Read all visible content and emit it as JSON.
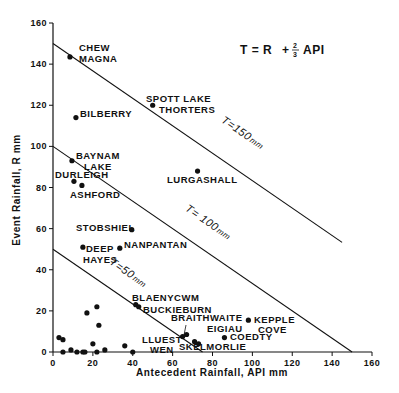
{
  "chart_data": {
    "type": "scatter",
    "title": "",
    "formula": {
      "text_left": "T = R",
      "plus": "+",
      "frac_num": "2",
      "frac_den": "3",
      "text_right": "API"
    },
    "xlabel": "Antecedent Rainfall, API mm",
    "ylabel": "Event Rainfall, R mm",
    "xlim": [
      0,
      160
    ],
    "ylim": [
      0,
      160
    ],
    "x_ticks": [
      0,
      20,
      40,
      60,
      80,
      100,
      120,
      140,
      160
    ],
    "y_ticks": [
      0,
      20,
      40,
      60,
      80,
      100,
      120,
      140,
      160
    ],
    "grid": false,
    "reference_lines": [
      {
        "name": "T=50mm",
        "label": "T=50mm",
        "T": 50,
        "points": [
          [
            0,
            50
          ],
          [
            75,
            0
          ]
        ]
      },
      {
        "name": "T=100mm",
        "label": "T=100mm",
        "T": 100,
        "points": [
          [
            0,
            100
          ],
          [
            150,
            0
          ]
        ]
      },
      {
        "name": "T=150mm",
        "label": "T=150mm",
        "T": 150,
        "points": [
          [
            0,
            150
          ],
          [
            145,
            53.3
          ]
        ]
      }
    ],
    "labeled_points": [
      {
        "label": "CHEW MAGNA",
        "lines": [
          "CHEW",
          "MAGNA"
        ],
        "x": 8.5,
        "y": 143.5
      },
      {
        "label": "BILBERRY",
        "lines": [
          "BILBERRY"
        ],
        "x": 11.5,
        "y": 114
      },
      {
        "label": "SPOTT LAKE / THORTERS",
        "lines": [
          "SPOTT LAKE",
          "THORTERS"
        ],
        "x": 50,
        "y": 120
      },
      {
        "label": "BAYNAM LAKE",
        "lines": [
          "BAYNAM",
          "LAKE"
        ],
        "x": 9.5,
        "y": 93
      },
      {
        "label": "DURLEIGH",
        "lines": [
          "DURLEIGH"
        ],
        "x": 10.5,
        "y": 83
      },
      {
        "label": "ASHFORD",
        "lines": [
          "ASHFORD"
        ],
        "x": 14.5,
        "y": 81
      },
      {
        "label": "LURGASHALL",
        "lines": [
          "LURGASHALL"
        ],
        "x": 72.5,
        "y": 88
      },
      {
        "label": "STOBSHIEL",
        "lines": [
          "STOBSHIEL"
        ],
        "x": 39.5,
        "y": 59.5
      },
      {
        "label": "DEEP HAYES",
        "lines": [
          "DEEP",
          "HAYES"
        ],
        "x": 15,
        "y": 51
      },
      {
        "label": "NANPANTAN",
        "lines": [
          "NANPANTAN"
        ],
        "x": 33.5,
        "y": 50.5
      },
      {
        "label": "BLAENYCWM",
        "lines": [
          "BLAENYCWM"
        ],
        "x": 41.5,
        "y": 23
      },
      {
        "label": "BUCKIEBURN",
        "lines": [
          "BUCKIEBURN"
        ],
        "x": 43,
        "y": 22
      },
      {
        "label": "BRAITHWAITE",
        "lines": [
          "BRAITHWAITE"
        ],
        "x": 67,
        "y": 8.5
      },
      {
        "label": "LLUEST WEN",
        "lines": [
          "LLUEST",
          "WEN"
        ],
        "x": 65,
        "y": 7.5
      },
      {
        "label": "SKELMORLIE",
        "lines": [
          "SKELMORLIE"
        ],
        "x": 71,
        "y": 5
      },
      {
        "label": "EIGIAU",
        "lines": [
          "EIGIAU"
        ],
        "x": 73,
        "y": 4
      },
      {
        "label": "COEDTY",
        "lines": [
          "COEDTY"
        ],
        "x": 86,
        "y": 7
      },
      {
        "label": "KEPPLE COVE",
        "lines": [
          "KEPPLE",
          "COVE"
        ],
        "x": 98,
        "y": 15.5
      }
    ],
    "unlabeled_points": [
      {
        "x": 3,
        "y": 7
      },
      {
        "x": 5,
        "y": 6
      },
      {
        "x": 5,
        "y": 0
      },
      {
        "x": 9,
        "y": 1
      },
      {
        "x": 12,
        "y": 0
      },
      {
        "x": 15,
        "y": 0
      },
      {
        "x": 16,
        "y": 0
      },
      {
        "x": 17,
        "y": 19
      },
      {
        "x": 20,
        "y": 4
      },
      {
        "x": 22,
        "y": 22
      },
      {
        "x": 22,
        "y": 0
      },
      {
        "x": 23,
        "y": 13
      },
      {
        "x": 26,
        "y": 1
      },
      {
        "x": 36,
        "y": 3
      },
      {
        "x": 40,
        "y": 0
      }
    ]
  }
}
